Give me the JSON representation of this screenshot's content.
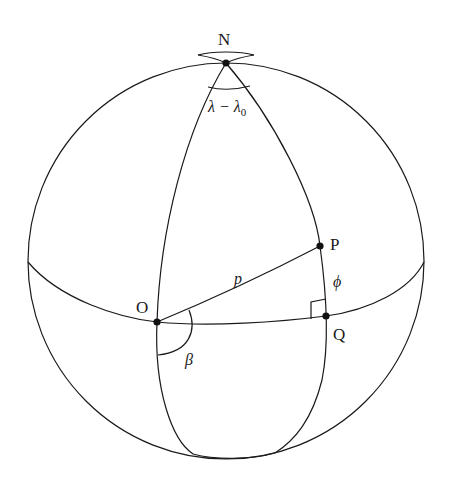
{
  "diagram": {
    "title": "",
    "labels": {
      "N": "N",
      "P": "P",
      "O": "O",
      "Q": "Q",
      "p": "p",
      "phi": "ϕ",
      "beta": "β",
      "lambda_diff": "λ − λ",
      "lambda_sub": "0"
    },
    "points": {
      "N": [
        226,
        63
      ],
      "O": [
        157,
        322
      ],
      "P": [
        320,
        246
      ],
      "Q": [
        326,
        316
      ]
    },
    "colors": {
      "stroke": "#1a1a1a",
      "background": "#ffffff"
    }
  }
}
